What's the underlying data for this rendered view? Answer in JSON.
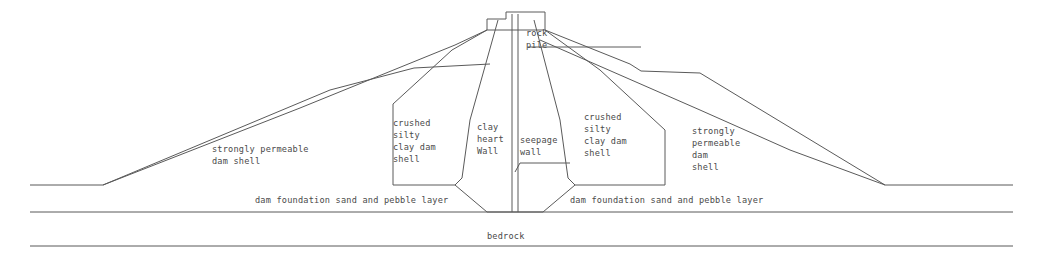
{
  "figure": {
    "type": "engineering-cross-section",
    "background_color": "#ffffff",
    "line_color": "#5a5a5a",
    "text_color": "#4a4a4a"
  },
  "labels": {
    "rock_pile": {
      "line1": "rock",
      "line2": "pile"
    },
    "shell_left": {
      "line1": "strongly permeable",
      "line2": "dam shell"
    },
    "crushed_left": {
      "line1": "crushed",
      "line2": "silty",
      "line3": "clay dam",
      "line4": "shell"
    },
    "clay_core": {
      "line1": "clay",
      "line2": "heart",
      "line3": "Wall"
    },
    "seepage_wall": {
      "line1": "seepage",
      "line2": "wall"
    },
    "crushed_right": {
      "line1": "crushed",
      "line2": "silty",
      "line3": "clay dam",
      "line4": "shell"
    },
    "shell_right": {
      "line1": "strongly",
      "line2": "permeable",
      "line3": "dam",
      "line4": "shell"
    },
    "foundation_left": "dam foundation sand and pebble layer",
    "foundation_right": "dam foundation sand and pebble layer",
    "bedrock": "bedrock"
  },
  "geometry": {
    "ground_line_y": 185,
    "foundation_base_y": 212,
    "bedrock_line_y": 246,
    "crest_top_y": 12,
    "dam_axis_x": 515,
    "left_toe_x": 103,
    "right_toe_x": 885,
    "ground_left_x": 30,
    "ground_right_x": 1013
  }
}
